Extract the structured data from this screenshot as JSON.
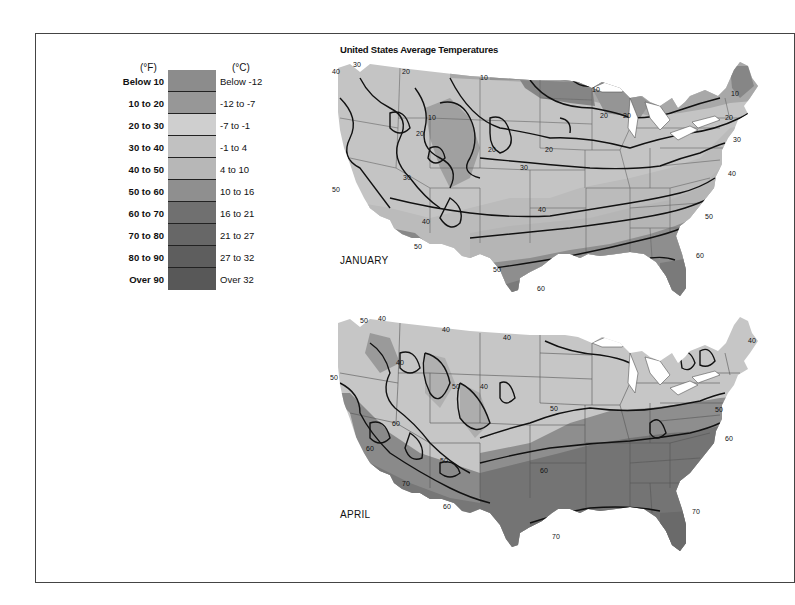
{
  "title": "United States Average Temperatures",
  "legend": {
    "header_f": "(°F)",
    "header_c": "(°C)",
    "bands": [
      {
        "f": "Below 10",
        "c": "Below -12",
        "color": "#8c8c8c"
      },
      {
        "f": "10 to 20",
        "c": "-12 to -7",
        "color": "#979797"
      },
      {
        "f": "20 to 30",
        "c": "-7 to -1",
        "color": "#cfcfcf"
      },
      {
        "f": "30 to 40",
        "c": "-1 to 4",
        "color": "#c1c1c1"
      },
      {
        "f": "40 to 50",
        "c": "4 to 10",
        "color": "#b7b7b7"
      },
      {
        "f": "50 to 60",
        "c": "10 to 16",
        "color": "#8f8f8f"
      },
      {
        "f": "60 to 70",
        "c": "16 to 21",
        "color": "#707070"
      },
      {
        "f": "70 to 80",
        "c": "21 to 27",
        "color": "#676767"
      },
      {
        "f": "80 to 90",
        "c": "27 to 32",
        "color": "#5e5e5e"
      },
      {
        "f": "Over 90",
        "c": "Over 32",
        "color": "#585858"
      }
    ]
  },
  "maps": [
    {
      "name": "JANUARY",
      "isotherm_labels": [
        "10",
        "20",
        "30",
        "40",
        "50",
        "60"
      ]
    },
    {
      "name": "APRIL",
      "isotherm_labels": [
        "40",
        "50",
        "60",
        "70"
      ]
    }
  ],
  "jan_labels": {
    "l30a": "30",
    "l40a": "40",
    "l20a": "20",
    "l10a": "10",
    "l20b": "20",
    "l10b": "10",
    "l20c": "20",
    "l20d": "20",
    "l10c": "10",
    "l20e": "20",
    "l20f": "20",
    "l30b": "30",
    "l30c": "30",
    "l40b": "40",
    "l50a": "50",
    "l50b": "50",
    "l40c": "40",
    "l50c": "50",
    "l50d": "50",
    "l60a": "60",
    "l60b": "60",
    "l40d": "40",
    "l20g": "20",
    "l10d": "10",
    "l30d": "30"
  },
  "apr_labels": {
    "l40a": "40",
    "l40b": "40",
    "l40c": "40",
    "l50a": "50",
    "l40d": "40",
    "l50b": "50",
    "l50c": "50",
    "l40e": "40",
    "l50d": "50",
    "l60a": "60",
    "l60b": "60",
    "l70a": "70",
    "l60c": "60",
    "l50e": "50",
    "l70b": "70",
    "l70c": "70",
    "l60d": "60",
    "l50f": "50",
    "l40f": "40",
    "l60e": "60"
  }
}
